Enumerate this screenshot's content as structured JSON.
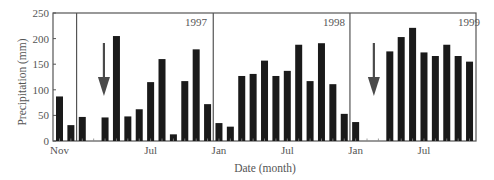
{
  "chart_data": {
    "type": "bar",
    "title": "",
    "xlabel": "Date (month)",
    "ylabel": "Precipitation (mm)",
    "ylim": [
      0,
      250
    ],
    "yticks": [
      0,
      50,
      100,
      150,
      200,
      250
    ],
    "grid": false,
    "legend": null,
    "categories": [
      "Nov 1996",
      "Dec 1996",
      "Jan 1997",
      "Feb 1997",
      "Mar 1997",
      "Apr 1997",
      "May 1997",
      "Jun 1997",
      "Jul 1997",
      "Aug 1997",
      "Sep 1997",
      "Oct 1997",
      "Nov 1997",
      "Dec 1997",
      "Jan 1998",
      "Feb 1998",
      "Mar 1998",
      "Apr 1998",
      "May 1998",
      "Jun 1998",
      "Jul 1998",
      "Aug 1998",
      "Sep 1998",
      "Oct 1998",
      "Nov 1998",
      "Dec 1998",
      "Jan 1999",
      "Feb 1999",
      "Mar 1999",
      "Apr 1999",
      "May 1999",
      "Jun 1999",
      "Jul 1999",
      "Aug 1999",
      "Sep 1999",
      "Oct 1999",
      "Nov 1999"
    ],
    "values": [
      87,
      31,
      47,
      0,
      46,
      205,
      48,
      62,
      115,
      160,
      13,
      117,
      179,
      72,
      35,
      28,
      127,
      131,
      157,
      127,
      137,
      188,
      117,
      191,
      111,
      53,
      37,
      0,
      0,
      175,
      203,
      221,
      173,
      166,
      188,
      166,
      155
    ],
    "xtick_labels": [
      {
        "label": "Nov",
        "index": 0
      },
      {
        "label": "Jul",
        "index": 8
      },
      {
        "label": "Jan",
        "index": 14
      },
      {
        "label": "Jul",
        "index": 20
      },
      {
        "label": "Jan",
        "index": 26
      },
      {
        "label": "Jul",
        "index": 32
      }
    ],
    "year_separators": [
      1.5,
      13.5,
      25.5
    ],
    "year_labels": [
      {
        "label": "1997",
        "x": 185
      },
      {
        "label": "1998",
        "x": 323
      },
      {
        "label": "1999",
        "x": 458
      }
    ],
    "annotations": [
      {
        "type": "arrow-down",
        "label": "dry-season arrow 1997",
        "index": 3.9
      },
      {
        "type": "arrow-down",
        "label": "dry-season arrow 1999",
        "index": 27.6
      }
    ],
    "colors": {
      "bar": "#1a1a1a",
      "axis": "#555555",
      "arrow": "#4a4a4a",
      "separator": "#555555"
    }
  }
}
